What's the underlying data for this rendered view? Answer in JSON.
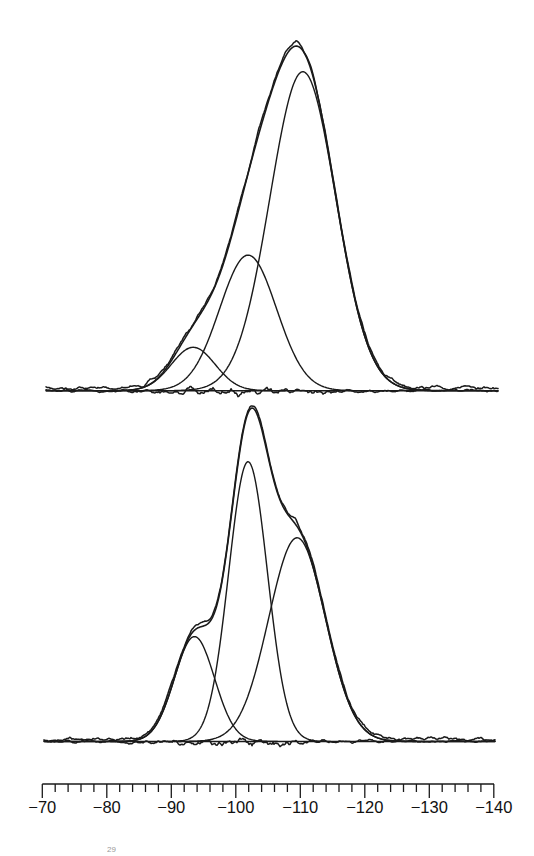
{
  "chart_data": {
    "type": "line",
    "title": "",
    "xlabel": "",
    "ylabel": "",
    "x_axis": {
      "reversed": true,
      "xlim": [
        -70,
        -140
      ],
      "major_ticks": [
        -70,
        -80,
        -90,
        -100,
        -110,
        -120,
        -130,
        -140
      ],
      "tick_labels": [
        "−70",
        "−80",
        "−90",
        "−100",
        "−110",
        "−120",
        "−130",
        "−140"
      ],
      "minor_tick_step": 2
    },
    "grid": false,
    "legend": null,
    "spectra": [
      {
        "name": "upper spectrum",
        "envelope_peak_ppm": -109.3,
        "components": [
          {
            "name": "Q2-like component",
            "center_ppm": -93.4,
            "relative_height": 0.136,
            "sigma_ppm": 3.4
          },
          {
            "name": "Q3 component",
            "center_ppm": -101.9,
            "relative_height": 0.425,
            "sigma_ppm": 4.4
          },
          {
            "name": "Q4 component",
            "center_ppm": -110.4,
            "relative_height": 1.0,
            "sigma_ppm": 5.1
          }
        ]
      },
      {
        "name": "lower spectrum",
        "envelope_peak_ppm": -102.3,
        "components": [
          {
            "name": "Q2-like component",
            "center_ppm": -93.6,
            "relative_height": 0.375,
            "sigma_ppm": 3.1
          },
          {
            "name": "Q3 component",
            "center_ppm": -101.9,
            "relative_height": 1.0,
            "sigma_ppm": 3.0
          },
          {
            "name": "Q4 component",
            "center_ppm": -109.5,
            "relative_height": 0.728,
            "sigma_ppm": 4.4
          }
        ]
      }
    ]
  },
  "layout": {
    "scale": {
      "x0_px": 42.3,
      "ppm0": -70,
      "px_per_ppm": 6.45
    },
    "upper": {
      "baseline_y": 390.7,
      "x_start": 46,
      "x_end": 498,
      "peak_height_px": 319,
      "seed": 7
    },
    "lower": {
      "baseline_y": 741.5,
      "x_start": 44,
      "x_end": 495,
      "peak_height_px": 279.8,
      "seed": 13
    },
    "axis": {
      "y": 784,
      "x_start": 42.3,
      "x_end": 494,
      "major_len": 14,
      "minor_len": 8,
      "label_y": 813
    }
  },
  "footer_fragment": "29"
}
